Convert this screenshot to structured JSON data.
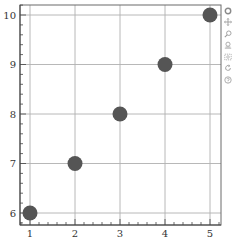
{
  "chart_data": {
    "type": "scatter",
    "title": "",
    "xlabel": "",
    "ylabel": "",
    "x": [
      1,
      2,
      3,
      4,
      5
    ],
    "series": [
      {
        "name": "points",
        "values": [
          6,
          7,
          8,
          9,
          10
        ],
        "color": "#555555"
      }
    ],
    "xlim": [
      0.8,
      5.25
    ],
    "ylim": [
      5.8,
      10.2
    ],
    "x_ticks": [
      "1",
      "2",
      "3",
      "4",
      "5"
    ],
    "y_ticks": [
      "6",
      "7",
      "8",
      "9",
      "10"
    ],
    "grid": true,
    "legend": "none"
  },
  "toolbar": {
    "tools": [
      {
        "name": "bokeh-logo",
        "label": "Bokeh"
      },
      {
        "name": "pan",
        "label": "Pan"
      },
      {
        "name": "zoom",
        "label": "Zoom"
      },
      {
        "name": "wheel-zoom",
        "label": "Wheel Zoom"
      },
      {
        "name": "box-zoom",
        "label": "Box Zoom"
      },
      {
        "name": "reset",
        "label": "Reset"
      },
      {
        "name": "help",
        "label": "Help"
      }
    ]
  },
  "colors": {
    "marker": "#555555",
    "grid": "#b0b0b0",
    "axis": "#444444",
    "icon": "#9a9a9a"
  }
}
